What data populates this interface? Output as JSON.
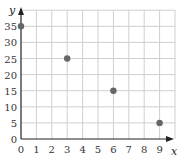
{
  "chart_data": {
    "type": "scatter",
    "title": "",
    "xlabel": "x",
    "ylabel": "y",
    "xlim": [
      0,
      9
    ],
    "ylim": [
      0,
      35
    ],
    "grid": true,
    "x_ticks": [
      "0",
      "1",
      "2",
      "3",
      "4",
      "5",
      "6",
      "7",
      "8",
      "9"
    ],
    "y_ticks": [
      "0",
      "5",
      "10",
      "15",
      "20",
      "25",
      "30",
      "35"
    ],
    "series": [
      {
        "name": "points",
        "x": [
          0,
          3,
          6,
          9
        ],
        "y": [
          35,
          25,
          15,
          5
        ],
        "color": "#666666"
      }
    ]
  }
}
